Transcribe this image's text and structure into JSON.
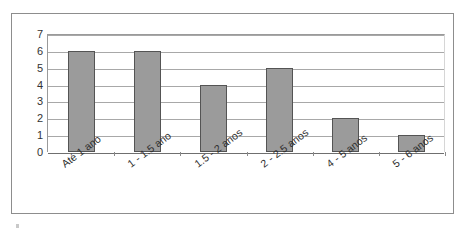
{
  "chart_data": {
    "type": "bar",
    "title": "",
    "xlabel": "",
    "ylabel": "",
    "categories": [
      "Até 1 ano",
      "1 - 1.5 ano",
      "1.5 - 2 anos",
      "2 - 2.5 anos",
      "4 - 5 anos",
      "5 - 6 anos"
    ],
    "values": [
      6,
      6,
      4,
      5,
      2,
      1
    ],
    "ylim": [
      0,
      7
    ],
    "yticks": [
      0,
      1,
      2,
      3,
      4,
      5,
      6,
      7
    ],
    "ytick_labels": [
      "0",
      "1",
      "2",
      "3",
      "4",
      "5",
      "6",
      "7"
    ],
    "grid": true,
    "legend": false,
    "legend_position": "none",
    "series": [
      {
        "name": "",
        "values": [
          6,
          6,
          4,
          5,
          2,
          1
        ]
      }
    ],
    "colors": {
      "bar_fill": "#9b9b9b",
      "bar_border": "#545454",
      "gridline": "#a8a8a8",
      "axis": "#6f6f6f",
      "frame": "#8d8d8d",
      "background": "#ffffff",
      "text": "#2e2e2e"
    }
  }
}
